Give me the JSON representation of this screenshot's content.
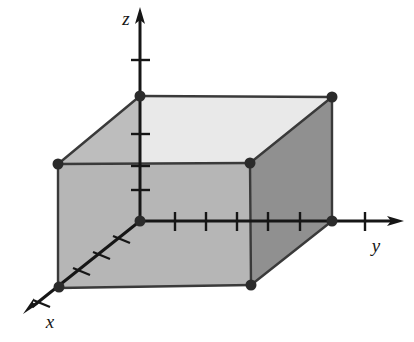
{
  "figure": {
    "background_color": "#ffffff",
    "width": 414,
    "height": 342
  },
  "axes": {
    "origin": {
      "x": 140,
      "y": 221
    },
    "line_color": "#161616",
    "items": [
      {
        "name": "x",
        "label": "x",
        "label_pos": {
          "x": 49,
          "y": 322
        },
        "direction": "down-left",
        "tip": {
          "x": 24,
          "y": 312
        },
        "ticks": [
          {
            "x": 121,
            "y": 236
          },
          {
            "x": 101,
            "y": 252
          },
          {
            "x": 81,
            "y": 268
          },
          {
            "x": 60,
            "y": 285
          },
          {
            "x": 40,
            "y": 301
          }
        ],
        "vertex_dot": {
          "x": 59,
          "y": 287
        }
      },
      {
        "name": "y",
        "label": "y",
        "label_pos": {
          "x": 376,
          "y": 246
        },
        "direction": "right",
        "tip": {
          "x": 403,
          "y": 221
        },
        "ticks": [
          175,
          206,
          237,
          268,
          300,
          365
        ],
        "vertex_dot": {
          "x": 332,
          "y": 221
        }
      },
      {
        "name": "z",
        "label": "z",
        "label_pos": {
          "x": 126,
          "y": 20
        },
        "direction": "up",
        "tip": {
          "x": 140,
          "y": 8
        },
        "ticks": [
          60,
          96,
          134,
          166,
          190
        ],
        "vertex_dot": {
          "x": 140,
          "y": 96
        }
      }
    ]
  },
  "box": {
    "vertices": [
      {
        "name": "back-top-left-on-z-axis",
        "x": 140,
        "y": 96
      },
      {
        "name": "back-top-right",
        "x": 332,
        "y": 97
      },
      {
        "name": "front-top-left",
        "x": 58,
        "y": 164
      },
      {
        "name": "front-top-right",
        "x": 250,
        "y": 163
      },
      {
        "name": "front-bottom-left-on-x-axis",
        "x": 58,
        "y": 288
      },
      {
        "name": "front-bottom-right",
        "x": 251,
        "y": 285
      },
      {
        "name": "back-bottom-right-on-y-axis",
        "x": 332,
        "y": 221
      }
    ],
    "faces": [
      {
        "name": "top-face",
        "color": "#e9e9e9",
        "points": "140,96 332,97 250,163 58,164"
      },
      {
        "name": "left-face",
        "color": "#bdbdbd",
        "points": "58,164 140,96 140,221 58,288"
      },
      {
        "name": "front-face",
        "color": "#b6b6b6",
        "points": "58,164 250,163 251,285 58,288"
      },
      {
        "name": "right-face",
        "color": "#909090",
        "points": "250,163 332,97 332,221 251,285"
      }
    ],
    "edge_color": "#3a3a3a",
    "vertex_dot_color": "#2b2b2b",
    "vertex_dot_radius": 5
  }
}
